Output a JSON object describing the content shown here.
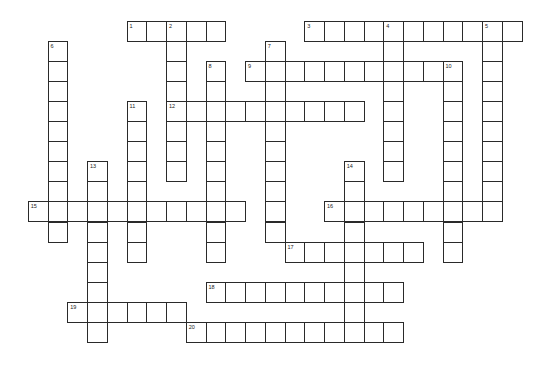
{
  "puzzle": {
    "type": "crossword",
    "grid_origin": {
      "x": 8,
      "y": 21
    },
    "cell_pitch": {
      "x": 19.75,
      "y": 20.05
    },
    "colors": {
      "border": "#2a2a2a",
      "cell": "#ffffff",
      "number": "#222222"
    },
    "words": [
      {
        "number": "1",
        "direction": "across",
        "col": 6,
        "row": 0,
        "length": 5
      },
      {
        "number": "2",
        "direction": "down",
        "col": 8,
        "row": 0,
        "length": 8
      },
      {
        "number": "3",
        "direction": "across",
        "col": 15,
        "row": 0,
        "length": 11
      },
      {
        "number": "4",
        "direction": "down",
        "col": 19,
        "row": 0,
        "length": 8
      },
      {
        "number": "5",
        "direction": "down",
        "col": 24,
        "row": 0,
        "length": 10
      },
      {
        "number": "6",
        "direction": "down",
        "col": 2,
        "row": 1,
        "length": 10
      },
      {
        "number": "7",
        "direction": "down",
        "col": 13,
        "row": 1,
        "length": 10
      },
      {
        "number": "8",
        "direction": "down",
        "col": 10,
        "row": 2,
        "length": 10
      },
      {
        "number": "9",
        "direction": "across",
        "col": 12,
        "row": 2,
        "length": 11
      },
      {
        "number": "10",
        "direction": "down",
        "col": 22,
        "row": 2,
        "length": 10
      },
      {
        "number": "11",
        "direction": "down",
        "col": 6,
        "row": 4,
        "length": 8
      },
      {
        "number": "12",
        "direction": "across",
        "col": 8,
        "row": 4,
        "length": 10
      },
      {
        "number": "13",
        "direction": "down",
        "col": 4,
        "row": 7,
        "length": 9
      },
      {
        "number": "14",
        "direction": "down",
        "col": 17,
        "row": 7,
        "length": 9
      },
      {
        "number": "15",
        "direction": "across",
        "col": 1,
        "row": 9,
        "length": 11
      },
      {
        "number": "16",
        "direction": "across",
        "col": 16,
        "row": 9,
        "length": 9
      },
      {
        "number": "17",
        "direction": "across",
        "col": 14,
        "row": 11,
        "length": 7
      },
      {
        "number": "18",
        "direction": "across",
        "col": 10,
        "row": 13,
        "length": 10
      },
      {
        "number": "19",
        "direction": "across",
        "col": 3,
        "row": 14,
        "length": 6
      },
      {
        "number": "20",
        "direction": "across",
        "col": 9,
        "row": 15,
        "length": 11
      }
    ]
  }
}
